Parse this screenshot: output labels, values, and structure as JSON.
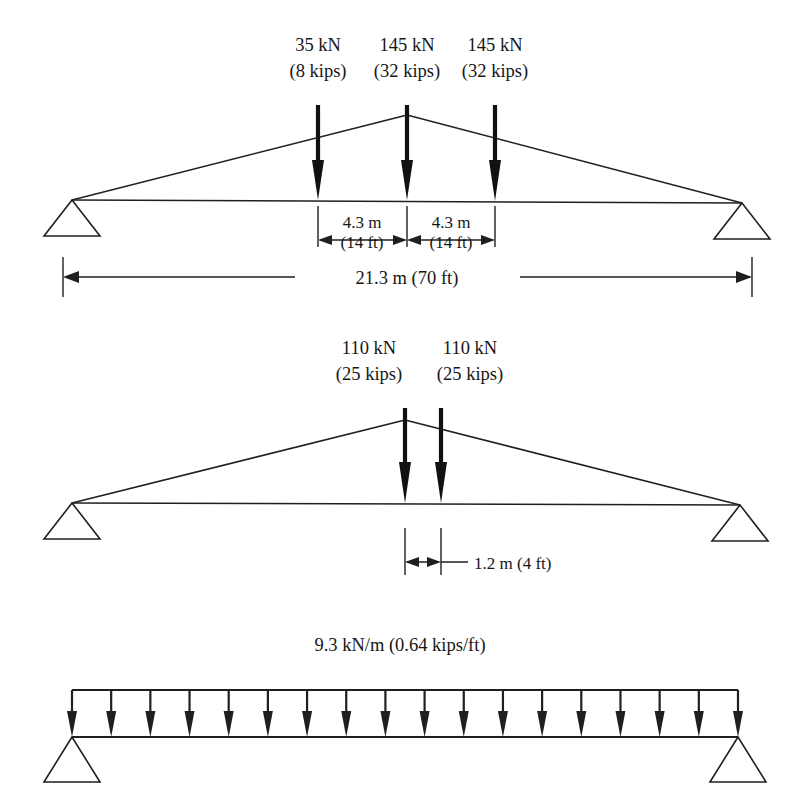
{
  "figure": {
    "background_color": "#ffffff",
    "line_color": "#1f1f1f",
    "text_color": "#161616"
  },
  "diagrams": [
    {
      "id": "truss-top",
      "type": "triangular-truss-point-loads",
      "loads": [
        {
          "magnitude_si": "35 kN",
          "magnitude_us": "(8 kips)",
          "x": 318
        },
        {
          "magnitude_si": "145 kN",
          "magnitude_us": "(32 kips)",
          "x": 407
        },
        {
          "magnitude_si": "145 kN",
          "magnitude_us": "(32 kips)",
          "x": 495
        }
      ],
      "dimensions": [
        {
          "name": "spacing-left",
          "label_si": "4.3 m",
          "label_us": "(14 ft)"
        },
        {
          "name": "spacing-right",
          "label_si": "4.3 m",
          "label_us": "(14 ft)"
        },
        {
          "name": "span",
          "label": "21.3 m (70 ft)"
        }
      ]
    },
    {
      "id": "truss-middle",
      "type": "triangular-truss-point-loads",
      "loads": [
        {
          "magnitude_si": "110 kN",
          "magnitude_us": "(25 kips)",
          "x": 405
        },
        {
          "magnitude_si": "110 kN",
          "magnitude_us": "(25 kips)",
          "x": 441
        }
      ],
      "dimensions": [
        {
          "name": "spacing",
          "label": "1.2 m (4 ft)"
        }
      ]
    },
    {
      "id": "beam-bottom",
      "type": "simply-supported-beam-udl",
      "udl": {
        "label": "9.3 kN/m (0.64 kips/ft)",
        "arrow_count": 18
      }
    }
  ],
  "labels": {
    "t1_load1_si": "35 kN",
    "t1_load1_us": "(8 kips)",
    "t1_load2_si": "145 kN",
    "t1_load2_us": "(32 kips)",
    "t1_load3_si": "145 kN",
    "t1_load3_us": "(32 kips)",
    "t1_dim_left_si": "4.3 m",
    "t1_dim_left_us": "(14 ft)",
    "t1_dim_right_si": "4.3 m",
    "t1_dim_right_us": "(14 ft)",
    "t1_span": "21.3 m (70 ft)",
    "t2_load1_si": "110 kN",
    "t2_load1_us": "(25 kips)",
    "t2_load2_si": "110 kN",
    "t2_load2_us": "(25 kips)",
    "t2_dim": "1.2 m (4 ft)",
    "b3_udl": "9.3 kN/m (0.64 kips/ft)"
  }
}
